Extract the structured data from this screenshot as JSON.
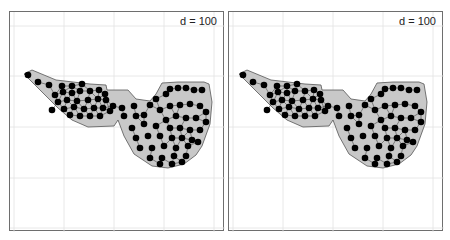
{
  "chart_data": [
    {
      "type": "scatter",
      "title": "d = 100",
      "description": "Point layout inside a grey polygon region; points connected by thin neighbor lines",
      "grid": true,
      "region_fill": "#c8c8c8",
      "point_color": "#000000",
      "region": [
        [
          14,
          62
        ],
        [
          22,
          58
        ],
        [
          46,
          68
        ],
        [
          80,
          72
        ],
        [
          96,
          73
        ],
        [
          97,
          78
        ],
        [
          118,
          78
        ],
        [
          126,
          87
        ],
        [
          140,
          89
        ],
        [
          146,
          82
        ],
        [
          152,
          71
        ],
        [
          168,
          70
        ],
        [
          194,
          70
        ],
        [
          199,
          72
        ],
        [
          202,
          90
        ],
        [
          200,
          112
        ],
        [
          192,
          134
        ],
        [
          186,
          143
        ],
        [
          174,
          152
        ],
        [
          158,
          156
        ],
        [
          142,
          154
        ],
        [
          124,
          142
        ],
        [
          114,
          124
        ],
        [
          108,
          108
        ],
        [
          104,
          114
        ],
        [
          78,
          115
        ],
        [
          62,
          108
        ],
        [
          48,
          96
        ],
        [
          20,
          68
        ]
      ],
      "points": [
        [
          18,
          63
        ],
        [
          28,
          70
        ],
        [
          39,
          73
        ],
        [
          52,
          74
        ],
        [
          62,
          74
        ],
        [
          72,
          72
        ],
        [
          45,
          83
        ],
        [
          53,
          80
        ],
        [
          62,
          81
        ],
        [
          70,
          79
        ],
        [
          80,
          79
        ],
        [
          89,
          78
        ],
        [
          95,
          82
        ],
        [
          48,
          90
        ],
        [
          57,
          88
        ],
        [
          67,
          89
        ],
        [
          78,
          88
        ],
        [
          88,
          87
        ],
        [
          96,
          88
        ],
        [
          54,
          97
        ],
        [
          64,
          95
        ],
        [
          74,
          97
        ],
        [
          84,
          96
        ],
        [
          93,
          96
        ],
        [
          103,
          94
        ],
        [
          42,
          98
        ],
        [
          60,
          103
        ],
        [
          70,
          104
        ],
        [
          80,
          104
        ],
        [
          90,
          104
        ],
        [
          100,
          99
        ],
        [
          112,
          96
        ],
        [
          124,
          94
        ],
        [
          114,
          104
        ],
        [
          126,
          104
        ],
        [
          134,
          103
        ],
        [
          140,
          93
        ],
        [
          146,
          87
        ],
        [
          156,
          82
        ],
        [
          160,
          77
        ],
        [
          168,
          76
        ],
        [
          176,
          76
        ],
        [
          184,
          78
        ],
        [
          192,
          78
        ],
        [
          150,
          98
        ],
        [
          160,
          94
        ],
        [
          170,
          93
        ],
        [
          180,
          92
        ],
        [
          190,
          94
        ],
        [
          196,
          100
        ],
        [
          156,
          108
        ],
        [
          166,
          104
        ],
        [
          176,
          106
        ],
        [
          186,
          106
        ],
        [
          196,
          110
        ],
        [
          146,
          114
        ],
        [
          160,
          116
        ],
        [
          170,
          116
        ],
        [
          180,
          118
        ],
        [
          190,
          118
        ],
        [
          122,
          116
        ],
        [
          134,
          112
        ],
        [
          126,
          126
        ],
        [
          138,
          124
        ],
        [
          150,
          124
        ],
        [
          162,
          126
        ],
        [
          172,
          126
        ],
        [
          182,
          128
        ],
        [
          130,
          136
        ],
        [
          142,
          136
        ],
        [
          154,
          134
        ],
        [
          166,
          136
        ],
        [
          178,
          134
        ],
        [
          188,
          130
        ],
        [
          140,
          146
        ],
        [
          152,
          146
        ],
        [
          164,
          144
        ],
        [
          176,
          144
        ],
        [
          150,
          152
        ],
        [
          162,
          152
        ],
        [
          172,
          150
        ]
      ]
    },
    {
      "type": "scatter",
      "title": "d = 100",
      "description": "Same region with a slightly different point arrangement",
      "grid": true,
      "region_fill": "#c8c8c8",
      "point_color": "#000000",
      "region": [
        [
          10,
          62
        ],
        [
          18,
          58
        ],
        [
          42,
          68
        ],
        [
          76,
          72
        ],
        [
          92,
          73
        ],
        [
          93,
          78
        ],
        [
          114,
          78
        ],
        [
          122,
          87
        ],
        [
          136,
          89
        ],
        [
          142,
          82
        ],
        [
          148,
          71
        ],
        [
          164,
          70
        ],
        [
          190,
          70
        ],
        [
          195,
          72
        ],
        [
          198,
          90
        ],
        [
          196,
          112
        ],
        [
          188,
          134
        ],
        [
          182,
          143
        ],
        [
          170,
          152
        ],
        [
          154,
          156
        ],
        [
          138,
          154
        ],
        [
          120,
          142
        ],
        [
          110,
          124
        ],
        [
          104,
          108
        ],
        [
          100,
          114
        ],
        [
          74,
          115
        ],
        [
          58,
          108
        ],
        [
          44,
          96
        ],
        [
          16,
          68
        ]
      ],
      "points": [
        [
          14,
          63
        ],
        [
          24,
          70
        ],
        [
          35,
          73
        ],
        [
          48,
          74
        ],
        [
          58,
          74
        ],
        [
          68,
          72
        ],
        [
          41,
          83
        ],
        [
          49,
          80
        ],
        [
          58,
          81
        ],
        [
          66,
          79
        ],
        [
          76,
          79
        ],
        [
          85,
          78
        ],
        [
          91,
          82
        ],
        [
          44,
          90
        ],
        [
          53,
          88
        ],
        [
          63,
          89
        ],
        [
          74,
          88
        ],
        [
          84,
          87
        ],
        [
          92,
          88
        ],
        [
          50,
          97
        ],
        [
          60,
          95
        ],
        [
          70,
          97
        ],
        [
          80,
          96
        ],
        [
          89,
          96
        ],
        [
          99,
          94
        ],
        [
          38,
          98
        ],
        [
          56,
          103
        ],
        [
          66,
          104
        ],
        [
          76,
          104
        ],
        [
          86,
          104
        ],
        [
          96,
          99
        ],
        [
          108,
          96
        ],
        [
          120,
          94
        ],
        [
          110,
          104
        ],
        [
          122,
          104
        ],
        [
          130,
          103
        ],
        [
          136,
          93
        ],
        [
          142,
          87
        ],
        [
          152,
          82
        ],
        [
          156,
          77
        ],
        [
          164,
          76
        ],
        [
          172,
          76
        ],
        [
          180,
          78
        ],
        [
          188,
          78
        ],
        [
          146,
          98
        ],
        [
          156,
          94
        ],
        [
          166,
          93
        ],
        [
          176,
          92
        ],
        [
          186,
          94
        ],
        [
          192,
          100
        ],
        [
          152,
          108
        ],
        [
          162,
          104
        ],
        [
          172,
          106
        ],
        [
          182,
          106
        ],
        [
          192,
          110
        ],
        [
          142,
          114
        ],
        [
          156,
          116
        ],
        [
          166,
          116
        ],
        [
          176,
          118
        ],
        [
          186,
          118
        ],
        [
          118,
          116
        ],
        [
          130,
          112
        ],
        [
          122,
          126
        ],
        [
          134,
          124
        ],
        [
          146,
          124
        ],
        [
          158,
          126
        ],
        [
          168,
          126
        ],
        [
          178,
          128
        ],
        [
          126,
          136
        ],
        [
          138,
          136
        ],
        [
          150,
          134
        ],
        [
          162,
          136
        ],
        [
          174,
          134
        ],
        [
          184,
          130
        ],
        [
          136,
          146
        ],
        [
          148,
          146
        ],
        [
          160,
          144
        ],
        [
          172,
          144
        ],
        [
          146,
          152
        ],
        [
          158,
          152
        ],
        [
          168,
          150
        ]
      ]
    }
  ],
  "panels": [
    {
      "label": "d = 100"
    },
    {
      "label": "d = 100"
    }
  ]
}
